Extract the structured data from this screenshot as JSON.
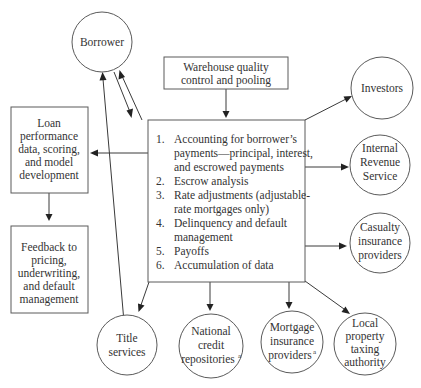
{
  "diagram": {
    "central_box": {
      "items": [
        {
          "num": "1.",
          "lines": [
            "Accounting for borrower’s",
            "payments—principal, interest,",
            "and escrowed payments"
          ]
        },
        {
          "num": "2.",
          "lines": [
            "Escrow analysis"
          ]
        },
        {
          "num": "3.",
          "lines": [
            "Rate adjustments (adjustable-",
            "rate mortgages only)"
          ]
        },
        {
          "num": "4.",
          "lines": [
            "Delinquency and default",
            "management"
          ]
        },
        {
          "num": "5.",
          "lines": [
            "Payoffs"
          ]
        },
        {
          "num": "6.",
          "lines": [
            "Accumulation of data"
          ]
        }
      ]
    },
    "warehouse_box": {
      "lines": [
        "Warehouse quality",
        "control and pooling"
      ]
    },
    "loan_performance_box": {
      "lines": [
        "Loan",
        "performance",
        "data, scoring,",
        "and model",
        "development"
      ]
    },
    "feedback_box": {
      "lines": [
        "Feedback to",
        "pricing,",
        "underwriting,",
        "and default",
        "management"
      ]
    },
    "circles": {
      "borrower": {
        "lines": [
          "Borrower"
        ]
      },
      "investors": {
        "lines": [
          "Investors"
        ]
      },
      "irs": {
        "lines": [
          "Internal",
          "Revenue",
          "Service"
        ]
      },
      "casualty": {
        "lines": [
          "Casualty",
          "insurance",
          "providers"
        ]
      },
      "title": {
        "lines": [
          "Title",
          "services"
        ]
      },
      "credit": {
        "lines": [
          "National",
          "credit",
          "repositories"
        ],
        "superscript": "a"
      },
      "mortgage_ins": {
        "lines": [
          "Mortgage",
          "insurance",
          "providers"
        ],
        "superscript": "a"
      },
      "local_tax": {
        "lines": [
          "Local",
          "property",
          "taxing",
          "authority"
        ]
      }
    },
    "colors": {
      "stroke": "#5a5a5a",
      "text": "#333333",
      "arrow": "#222222",
      "background": "#ffffff"
    }
  }
}
